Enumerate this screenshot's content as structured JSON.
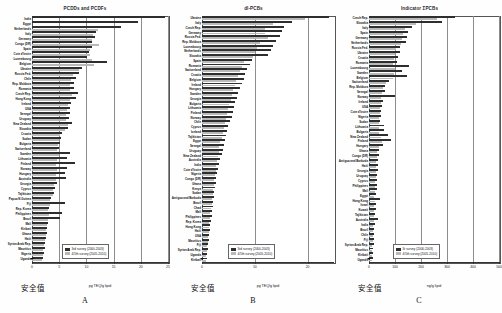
{
  "figure": {
    "safety_label": "安全值",
    "panels": [
      {
        "letter": "A",
        "title": "PCDDs and PCDFs",
        "unit": "pg TEQ/g lipid",
        "safety_x": 0.0,
        "legend": [
          {
            "key": "3rd survey (2000-2003)",
            "color": "#2e2e2e"
          },
          {
            "key": "4/5th survey (2005-2010)",
            "color": "#b9b9b9"
          }
        ]
      },
      {
        "letter": "B",
        "title": "dl-PCBs",
        "unit": "pg TEQ/g lipid",
        "safety_x": 0.0,
        "legend": [
          {
            "key": "3rd survey (2000-2003)",
            "color": "#2e2e2e"
          },
          {
            "key": "4/5th survey (2005-2010)",
            "color": "#b9b9b9"
          }
        ]
      },
      {
        "letter": "C",
        "title": "Indicator ΣPCBs",
        "unit": "ng/g lipid",
        "safety_x": 0.0,
        "legend": [
          {
            "key": "3r survey (2000-2003)",
            "color": "#2e2e2e"
          },
          {
            "key": "4/5th survey (2005-2010)",
            "color": "#b9b9b9"
          }
        ]
      }
    ]
  },
  "chart_data": [
    {
      "type": "bar",
      "title": "PCDDs and PCDFs",
      "xlabel": "pg TEQ/g lipid",
      "ylabel": "",
      "xlim": [
        0,
        25
      ],
      "xticks": [
        0,
        5,
        10,
        15,
        20,
        25
      ],
      "xticklabels": [
        "0",
        "5",
        "10",
        "15",
        "20",
        "25"
      ],
      "grid": true,
      "legend_position": "bottom-right",
      "orientation": "horizontal",
      "categories": [
        "India",
        "Egypt",
        "Netherlands",
        "Italy",
        "Germany",
        "Congo (DR)",
        "Spain",
        "Cote d'Ivoire",
        "Luxembourg",
        "Belgium",
        "Ukraine",
        "Russia Fed.",
        "Chile",
        "Rep. Moldova",
        "Romania",
        "Czech Rep.",
        "Hong Kong",
        "Ireland",
        "USA",
        "Senegal",
        "Uruguay",
        "New Zealand",
        "Slovakia",
        "Croatia",
        "Sudan",
        "Bulgaria",
        "Switzerland",
        "Sweden",
        "Lithuania",
        "Finland",
        "Norway",
        "Hungary",
        "Australia",
        "Georgia",
        "Cyprus",
        "Tajikistan",
        "Papua N.Guinea",
        "Fiji",
        "Rep. Korea",
        "Philippines",
        "Brazil",
        "Mali",
        "Kiribati",
        "Ghana",
        "Haiti",
        "Syrian Arab Rep.",
        "Mauritius",
        "Nigeria",
        "Uganda"
      ],
      "series": [
        {
          "name": "3rd survey (2000-2003)",
          "color": "#2e2e2e",
          "values": [
            24.5,
            19.5,
            16.4,
            11.8,
            11.5,
            11.0,
            11.0,
            10.4,
            10.2,
            13.8,
            9.2,
            8.6,
            8.1,
            7.8,
            7.7,
            8.4,
            8.0,
            7.2,
            7.0,
            6.9,
            6.8,
            7.3,
            6.6,
            5.6,
            5.3,
            5.2,
            5.0,
            7.0,
            6.4,
            7.9,
            6.4,
            6.0,
            6.2,
            4.6,
            4.2,
            4.0,
            3.5,
            6.0,
            3.2,
            5.5,
            5.2,
            3.0,
            2.8,
            2.7,
            2.5,
            2.4,
            2.3,
            2.2,
            2.0
          ]
        },
        {
          "name": "4/5th survey (2005-2010)",
          "color": "#b9b9b9",
          "values": [
            null,
            null,
            12.2,
            11.2,
            11.0,
            12.4,
            10.6,
            10.6,
            11.0,
            11.4,
            8.6,
            7.6,
            7.2,
            7.0,
            7.0,
            7.4,
            7.0,
            6.6,
            6.4,
            6.3,
            6.2,
            6.6,
            6.0,
            5.2,
            4.9,
            4.8,
            4.6,
            5.0,
            4.6,
            4.5,
            4.6,
            4.4,
            4.4,
            4.1,
            3.9,
            3.8,
            3.3,
            3.4,
            3.0,
            3.2,
            3.0,
            2.8,
            2.6,
            2.5,
            2.3,
            2.2,
            2.1,
            2.0,
            1.9
          ]
        }
      ]
    },
    {
      "type": "bar",
      "title": "dl-PCBs",
      "xlabel": "pg TEQ/g lipid",
      "ylabel": "",
      "xlim": [
        0,
        25
      ],
      "xticks": [
        0,
        10,
        20
      ],
      "xticklabels": [
        "0",
        "10",
        "20"
      ],
      "grid": true,
      "legend_position": "bottom-right",
      "orientation": "horizontal",
      "categories": [
        "Ukraine",
        "Italy",
        "Czech Rep.",
        "Germany",
        "Russia Fed.",
        "Rep. Moldova",
        "Luxembourg",
        "Netherlands",
        "Slovakia",
        "Spain",
        "Romania",
        "Switzerland",
        "Croatia",
        "Belgium",
        "Ireland",
        "Hungary",
        "Sweden",
        "Georgia",
        "Bulgaria",
        "Lithuania",
        "Finland",
        "Norway",
        "Chile",
        "Cyprus",
        "Iceland",
        "Tajikistan",
        "Egypt",
        "Senegal",
        "Uruguay",
        "New Zealand",
        "Australia",
        "India",
        "Cote d'Ivoire",
        "Nigeria",
        "Congo (DR)",
        "Ghana",
        "Kenya",
        "Sudan",
        "Antigua and Barbuda",
        "Brazil",
        "Chad",
        "Mali",
        "Philippines",
        "Rep. Korea",
        "Hong Kong",
        "Haiti",
        "USA",
        "Mauritius",
        "Fiji",
        "Syrian Arab Rep.",
        "Uganda",
        "Kiribati"
      ],
      "series": [
        {
          "name": "3rd survey (2000-2003)",
          "color": "#2e2e2e",
          "values": [
            24.0,
            17.0,
            15.5,
            15.2,
            14.8,
            14.0,
            13.5,
            13.0,
            12.5,
            9.5,
            9.0,
            8.6,
            8.2,
            8.0,
            7.6,
            7.2,
            6.9,
            6.6,
            6.3,
            6.0,
            5.8,
            5.6,
            5.3,
            5.0,
            4.8,
            4.6,
            4.3,
            4.1,
            3.9,
            3.7,
            3.5,
            3.3,
            3.1,
            2.9,
            2.7,
            2.6,
            2.4,
            2.3,
            2.2,
            2.1,
            2.0,
            1.9,
            1.8,
            1.7,
            1.6,
            1.5,
            1.4,
            1.3,
            1.2,
            1.1,
            1.0,
            0.9
          ]
        },
        {
          "name": "4/5th survey (2005-2010)",
          "color": "#b9b9b9",
          "values": [
            19.5,
            13.5,
            12.0,
            12.0,
            12.5,
            11.0,
            10.5,
            10.0,
            9.6,
            8.0,
            7.6,
            7.2,
            6.8,
            6.5,
            6.2,
            5.9,
            5.6,
            5.4,
            5.1,
            4.9,
            4.7,
            4.5,
            4.3,
            4.1,
            3.9,
            3.7,
            3.5,
            3.3,
            3.2,
            3.0,
            2.9,
            2.7,
            2.6,
            2.4,
            2.3,
            2.2,
            2.1,
            2.0,
            1.9,
            1.8,
            1.7,
            1.6,
            1.5,
            1.4,
            1.4,
            1.3,
            1.2,
            1.1,
            1.0,
            0.9,
            0.8,
            0.7
          ]
        }
      ]
    },
    {
      "type": "bar",
      "title": "Indicator ΣPCBs",
      "xlabel": "ng/g lipid",
      "ylabel": "",
      "xlim": [
        0,
        500
      ],
      "xticks": [
        0,
        100,
        200,
        300,
        400,
        500
      ],
      "xticklabels": [
        "0",
        "100",
        "200",
        "300",
        "400",
        "500"
      ],
      "grid": true,
      "legend_position": "bottom-right",
      "orientation": "horizontal",
      "categories": [
        "Czech Rep.",
        "Slovakia",
        "Italy",
        "Spain",
        "Germany",
        "Netherlands",
        "Russia Fed.",
        "Ukraine",
        "Croatia",
        "Romania",
        "Luxembourg",
        "Sweden",
        "Belgium",
        "Switzerland",
        "Rep. Moldova",
        "Senegal",
        "Norway",
        "Ireland",
        "USA",
        "Cote d'Ivoire",
        "Nigeria",
        "Sudan",
        "Lithuania",
        "Bulgaria",
        "New Zealand",
        "Finland",
        "Hungary",
        "Ghana",
        "Congo (DR)",
        "Antigua and Barbuda",
        "Haiti",
        "Georgia",
        "Uruguay",
        "Cyprus",
        "Philippines",
        "Mali",
        "Egypt",
        "Hong Kong",
        "Israel",
        "Kuwait",
        "Tajikistan",
        "Australia",
        "India",
        "Brazil",
        "Chile",
        "Fiji",
        "Syrian Arab Rep.",
        "Mauritius",
        "Kiribati",
        "Uganda"
      ],
      "series": [
        {
          "name": "3r survey (2000-2003)",
          "color": "#2e2e2e",
          "values": [
            330,
            280,
            165,
            150,
            148,
            142,
            120,
            118,
            112,
            108,
            155,
            125,
            148,
            78,
            62,
            60,
            100,
            54,
            50,
            48,
            46,
            44,
            58,
            56,
            72,
            85,
            54,
            40,
            38,
            36,
            34,
            33,
            32,
            31,
            30,
            29,
            28,
            42,
            26,
            25,
            24,
            33,
            22,
            21,
            20,
            19,
            18,
            17,
            16,
            15
          ]
        },
        {
          "name": "4/5th survey (2005-2010)",
          "color": "#b9b9b9",
          "values": [
            262,
            180,
            140,
            130,
            128,
            122,
            104,
            100,
            96,
            92,
            100,
            95,
            92,
            66,
            52,
            50,
            48,
            46,
            44,
            42,
            40,
            38,
            40,
            38,
            46,
            50,
            38,
            32,
            30,
            28,
            27,
            26,
            25,
            24,
            23,
            22,
            21,
            24,
            20,
            19,
            18,
            20,
            17,
            16,
            15,
            14,
            13,
            12,
            11,
            10
          ]
        }
      ]
    }
  ]
}
